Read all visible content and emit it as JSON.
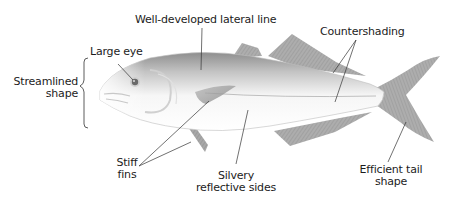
{
  "diagram": {
    "colors": {
      "background": "#ffffff",
      "text": "#1c1c1c",
      "leader_line": "#333333",
      "fish_body_light": "#f4f4f4",
      "fish_body_dark": "#9a9a9a",
      "fin": "#8c8c8c",
      "eye": "#6a6a6a"
    },
    "labels": {
      "lateral_line": "Well-developed lateral line",
      "countershading": "Countershading",
      "large_eye": "Large eye",
      "streamlined_1": "Streamlined",
      "streamlined_2": "shape",
      "stiff_fins_1": "Stiff",
      "stiff_fins_2": "fins",
      "silvery_1": "Silvery",
      "silvery_2": "reflective sides",
      "tail_1": "Efficient tail",
      "tail_2": "shape"
    }
  }
}
